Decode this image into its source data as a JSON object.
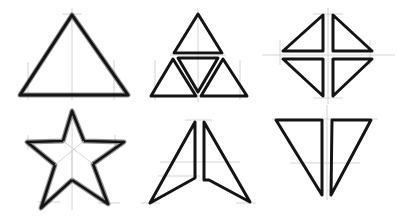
{
  "canvas": {
    "width": 397,
    "height": 224,
    "background": "#ffffff"
  },
  "style": {
    "ink_color": "#141414",
    "guide_color": "#c9c9c9"
  },
  "shapes": [
    {
      "id": "triangle",
      "label": "Triangle",
      "points": "72,15 128,95 20,95"
    },
    {
      "id": "triforce",
      "label": "Triforce",
      "outer": "198,14 248,97 150,97",
      "inner": "174,55 222,55 198,97",
      "sub": [
        "198,14 222,55 174,55",
        "174,57 198,97 150,97",
        "222,57 248,97 198,97"
      ]
    },
    {
      "id": "split-diamond",
      "label": "Split Diamond",
      "quads": [
        "323,14 323,52 282,52",
        "333,14 333,52 373,52",
        "282,58 323,58 323,97",
        "333,58 373,58 333,97"
      ]
    },
    {
      "id": "star",
      "label": "Five-point Star",
      "points": "72,111 84,141 124,142 93,164 108,204 72,180 41,208 55,165 27,142 63,141"
    },
    {
      "id": "arrowhead",
      "label": "Split Arrowhead",
      "left": "195,121 195,178 149,203",
      "right": "204,121 251,203 209,180 204,180"
    },
    {
      "id": "split-down-triangle",
      "label": "Split Down Triangle",
      "left": "275,119 322,119 322,196",
      "right": "332,119 372,119 330,196"
    }
  ]
}
